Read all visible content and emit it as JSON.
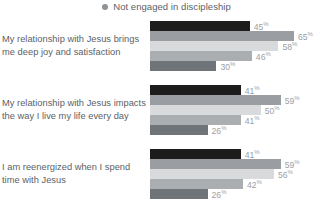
{
  "legend": {
    "items": [
      {
        "label": "Not engaged in discipleship",
        "color": "#8e9398",
        "marker": "legend-dot-icon"
      }
    ]
  },
  "chart_data": {
    "type": "bar",
    "orientation": "horizontal",
    "title": "",
    "subtitle": "",
    "xlabel": "",
    "ylabel": "",
    "xlim": [
      0,
      70
    ],
    "grid": false,
    "legend_position": "top-center",
    "value_suffix": "%",
    "categories": [
      "My relationship with Jesus brings me deep joy and satisfaction",
      "My relationship with Jesus impacts the way I live my life every day",
      "I am reenergized when I spend time with Jesus"
    ],
    "series": [
      {
        "name": "series-1",
        "color": "#1c1c1c",
        "values": [
          45,
          41,
          41
        ]
      },
      {
        "name": "series-2",
        "color": "#9a9ea2",
        "values": [
          65,
          59,
          59
        ]
      },
      {
        "name": "series-3",
        "color": "#d9dadb",
        "values": [
          58,
          50,
          56
        ]
      },
      {
        "name": "series-4",
        "color": "#aaaeb1",
        "values": [
          46,
          41,
          42
        ]
      },
      {
        "name": "series-5",
        "color": "#6f7478",
        "values": [
          30,
          26,
          26
        ]
      }
    ],
    "groups": [
      {
        "label": "My relationship with Jesus brings me deep joy and satisfaction",
        "bars": [
          {
            "value": 45,
            "label": "45",
            "suffix": "%",
            "color": "#1c1c1c"
          },
          {
            "value": 65,
            "label": "65",
            "suffix": "%",
            "color": "#9a9ea2"
          },
          {
            "value": 58,
            "label": "58",
            "suffix": "%",
            "color": "#d9dadb"
          },
          {
            "value": 46,
            "label": "46",
            "suffix": "%",
            "color": "#aaaeb1"
          },
          {
            "value": 30,
            "label": "30",
            "suffix": "%",
            "color": "#6f7478"
          }
        ]
      },
      {
        "label": "My relationship with Jesus impacts the way I live my life every day",
        "bars": [
          {
            "value": 41,
            "label": "41",
            "suffix": "%",
            "color": "#1c1c1c"
          },
          {
            "value": 59,
            "label": "59",
            "suffix": "%",
            "color": "#9a9ea2"
          },
          {
            "value": 50,
            "label": "50",
            "suffix": "%",
            "color": "#d9dadb"
          },
          {
            "value": 41,
            "label": "41",
            "suffix": "%",
            "color": "#aaaeb1"
          },
          {
            "value": 26,
            "label": "26",
            "suffix": "%",
            "color": "#6f7478"
          }
        ]
      },
      {
        "label": "I am reenergized when I spend time with Jesus",
        "bars": [
          {
            "value": 41,
            "label": "41",
            "suffix": "%",
            "color": "#1c1c1c"
          },
          {
            "value": 59,
            "label": "59",
            "suffix": "%",
            "color": "#9a9ea2"
          },
          {
            "value": 56,
            "label": "56",
            "suffix": "%",
            "color": "#d9dadb"
          },
          {
            "value": 42,
            "label": "42",
            "suffix": "%",
            "color": "#aaaeb1"
          },
          {
            "value": 26,
            "label": "26",
            "suffix": "%",
            "color": "#6f7478"
          }
        ]
      }
    ]
  }
}
